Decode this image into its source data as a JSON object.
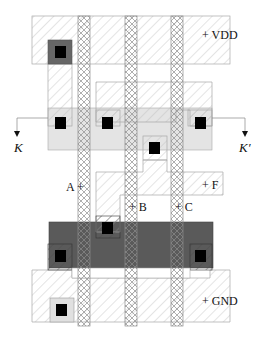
{
  "diagram": {
    "type": "cmos-layout",
    "labels": {
      "vdd": "+ VDD",
      "gnd": "+ GND",
      "input_a": "A +",
      "input_b": "+ B",
      "input_c": "+ C",
      "output_f": "+ F",
      "cut_left": "K",
      "cut_right": "K′"
    },
    "colors": {
      "metal_hatch": "#b8b8b8",
      "poly_hatch": "#8a8a8a",
      "p_diffusion": "#e2e2e2",
      "n_diffusion": "#555555",
      "contact": "#000000",
      "via_pad": "#6a6a6a",
      "outline": "#9a9a9a"
    },
    "layers": [
      "metal",
      "polysilicon",
      "p-diffusion",
      "n-diffusion",
      "contact"
    ]
  }
}
